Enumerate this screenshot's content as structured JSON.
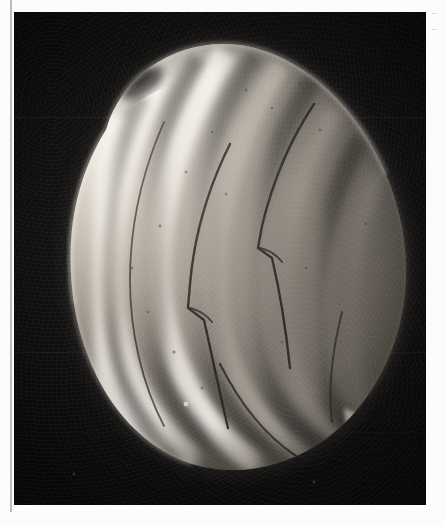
{
  "page": {
    "background_color": "#fcfcfa",
    "kind": "printed plate page scan",
    "gutter_rule_color": "#b8b8b8"
  },
  "plate": {
    "label": "",
    "caption": "",
    "background_color": "#0c0b0b",
    "frame": {
      "x": 14,
      "y": 12,
      "width": 412,
      "height": 493
    }
  },
  "margin_marks": [
    {
      "name": "register-mark-upper",
      "x": 432,
      "y": 13
    },
    {
      "name": "register-mark-lower",
      "x": 432,
      "y": 29
    }
  ],
  "specimen": {
    "name": "pollen-grain",
    "imaging": "scanning electron micrograph",
    "shape": "prolate ellipsoid",
    "orientation_degrees": -38,
    "surface": "longitudinally ridged with deep furrows (colpi)",
    "highlight_color": "#efe9df",
    "midtone_color": "#8d867c",
    "shadow_color": "#2a2724",
    "ridge_count": 6,
    "features": [
      {
        "name": "apex-notch-upper-left",
        "description": "dark depression at the upper-left pole"
      },
      {
        "name": "colpus-kink-upper-right",
        "description": "angular offset where a furrow steps sideways"
      },
      {
        "name": "colpus-kink-center",
        "description": "angular offset in the central furrow"
      },
      {
        "name": "apex-lobes-lower-right",
        "description": "splayed lobes at the lower-right pole"
      },
      {
        "name": "debris-particle",
        "description": "small bright speck on the dark field at lower left"
      }
    ]
  },
  "scale_bar": {
    "visible": false,
    "label": ""
  },
  "annotations": []
}
